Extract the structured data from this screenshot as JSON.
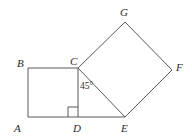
{
  "figure": {
    "kind": "geometry-diagram",
    "background_color": "#ffffff",
    "stroke_color": "#595959",
    "text_color": "#2b2b2b",
    "stroke_width": 1,
    "points": {
      "A": {
        "x": 28,
        "y": 117,
        "label": "A",
        "label_x": 14,
        "label_y": 123
      },
      "B": {
        "x": 28,
        "y": 68,
        "label": "B",
        "label_x": 17,
        "label_y": 58
      },
      "C": {
        "x": 78,
        "y": 68,
        "label": "C",
        "label_x": 70,
        "label_y": 56
      },
      "D": {
        "x": 78,
        "y": 117,
        "label": "D",
        "label_x": 73,
        "label_y": 123
      },
      "E": {
        "x": 125,
        "y": 117,
        "label": "E",
        "label_x": 121,
        "label_y": 123
      },
      "F": {
        "x": 172,
        "y": 70,
        "label": "F",
        "label_x": 176,
        "label_y": 62
      },
      "G": {
        "x": 125,
        "y": 22,
        "label": "G",
        "label_x": 120,
        "label_y": 7
      }
    },
    "segments": [
      {
        "name": "segment-AB",
        "from": "A",
        "to": "B"
      },
      {
        "name": "segment-BC",
        "from": "B",
        "to": "C"
      },
      {
        "name": "segment-CD",
        "from": "C",
        "to": "D"
      },
      {
        "name": "segment-DA",
        "from": "D",
        "to": "A"
      },
      {
        "name": "segment-DE",
        "from": "D",
        "to": "E"
      },
      {
        "name": "segment-CE",
        "from": "C",
        "to": "E"
      },
      {
        "name": "segment-CG",
        "from": "C",
        "to": "G"
      },
      {
        "name": "segment-GF",
        "from": "G",
        "to": "F"
      },
      {
        "name": "segment-FE",
        "from": "F",
        "to": "E"
      }
    ],
    "angles": [
      {
        "name": "angle-at-C",
        "vertex": "C",
        "value": "45°",
        "label_x": 80,
        "label_y": 82
      }
    ],
    "right_angle_marks": [
      {
        "name": "right-angle-mark-D",
        "vertex": "D",
        "size": 10
      }
    ]
  }
}
